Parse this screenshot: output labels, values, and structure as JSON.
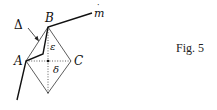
{
  "figure": {
    "caption": "Fig. 5",
    "labels": {
      "A": "A",
      "B": "B",
      "C": "C",
      "delta_upper": "Δ",
      "m_hat": "m",
      "m_hat_accent": "˙",
      "epsilon": "ε",
      "delta_lower": "δ"
    },
    "points": {
      "A": [
        26,
        61
      ],
      "B": [
        48,
        27
      ],
      "C": [
        71,
        61
      ],
      "bottom": [
        48,
        93
      ],
      "center": [
        48,
        61
      ],
      "m_end": [
        92,
        13
      ]
    },
    "colors": {
      "line": "#111111",
      "thin_line": "#333333",
      "background": "#ffffff"
    }
  }
}
